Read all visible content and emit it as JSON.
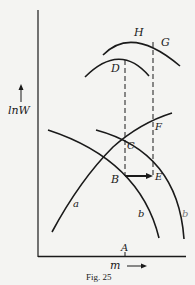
{
  "figure": {
    "caption": "Fig. 25",
    "y_axis_label": "lnW",
    "x_axis_label": "m",
    "points": {
      "A": "A",
      "B": "B",
      "C": "C",
      "D": "D",
      "E": "E",
      "F": "F",
      "G": "G",
      "H": "H"
    },
    "curves": {
      "a": "a",
      "b": "b",
      "b_prime": "b"
    }
  }
}
